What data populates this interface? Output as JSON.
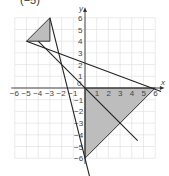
{
  "caption": "(−5)",
  "chart_data": {
    "type": "diagram",
    "title": "",
    "xlabel": "x",
    "ylabel": "y",
    "xlim": [
      -6,
      6
    ],
    "ylim": [
      -6,
      6
    ],
    "x_ticks": [
      "-6",
      "-5",
      "-4",
      "-3",
      "-2",
      "-1",
      "0",
      "1",
      "2",
      "3",
      "4",
      "5",
      "6"
    ],
    "y_ticks": [
      "6",
      "5",
      "4",
      "3",
      "2",
      "1",
      "-1",
      "-2",
      "-3",
      "-4",
      "-5",
      "-6"
    ],
    "grid": true,
    "shaded_triangles": [
      {
        "name": "upper-left-triangle",
        "vertices": [
          [
            -5,
            4
          ],
          [
            -3,
            6
          ],
          [
            -3,
            4
          ]
        ]
      },
      {
        "name": "lower-right-triangle",
        "vertices": [
          [
            0,
            0
          ],
          [
            6,
            0
          ],
          [
            0,
            -6
          ]
        ]
      }
    ],
    "lines": [
      {
        "name": "line-a",
        "from": [
          -5,
          4
        ],
        "to": [
          6.5,
          -0.3
        ]
      },
      {
        "name": "line-b",
        "from": [
          -3,
          6
        ],
        "to": [
          0.5,
          -8
        ]
      },
      {
        "name": "line-c",
        "from": [
          -4,
          4
        ],
        "to": [
          4.5,
          -4.5
        ]
      }
    ]
  }
}
